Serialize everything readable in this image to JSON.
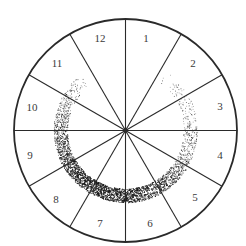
{
  "diagram": {
    "type": "clock-sector-wheel",
    "center": {
      "x": 125.5,
      "y": 130.5
    },
    "outer_radius": 111.5,
    "sector_count": 12,
    "line_color": "#2a2a2a",
    "dot_color": "#1a1a1a",
    "sectors": [
      {
        "label": "12",
        "x": 100,
        "y": 42
      },
      {
        "label": "1",
        "x": 146,
        "y": 42
      },
      {
        "label": "2",
        "x": 193,
        "y": 67
      },
      {
        "label": "3",
        "x": 220,
        "y": 110
      },
      {
        "label": "4",
        "x": 220,
        "y": 159
      },
      {
        "label": "5",
        "x": 195,
        "y": 201
      },
      {
        "label": "6",
        "x": 150,
        "y": 227
      },
      {
        "label": "7",
        "x": 100,
        "y": 227
      },
      {
        "label": "8",
        "x": 56,
        "y": 203
      },
      {
        "label": "9",
        "x": 30,
        "y": 159
      },
      {
        "label": "10",
        "x": 32,
        "y": 111
      },
      {
        "label": "11",
        "x": 57,
        "y": 67
      }
    ],
    "stippled_ring": {
      "inner_radius": 58,
      "outer_radius": 72,
      "gap_start_deg": -34,
      "gap_end_deg": 32,
      "density_note": "sparse near top (sectors 11 and 2), densest at bottom (sectors 6-7)"
    }
  }
}
